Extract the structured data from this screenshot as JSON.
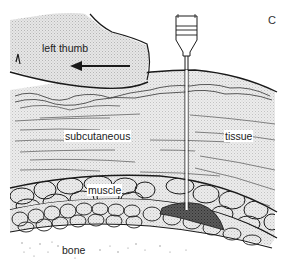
{
  "panel_letter": "C",
  "labels": {
    "thumb": "left thumb",
    "subcutaneous": "subcutaneous",
    "tissue": "tissue",
    "muscle": "muscle",
    "bone": "bone"
  },
  "colors": {
    "outline": "#1a1a1a",
    "stipple": "#cfcfcf",
    "deposit": "#4a4a4a",
    "background": "#ffffff"
  }
}
